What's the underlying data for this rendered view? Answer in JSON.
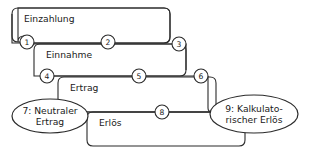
{
  "diagram": {
    "stroke_color": "#2b2b2b",
    "background_color": "#ffffff",
    "boxes": [
      {
        "id": "box-einzahlung",
        "label": "Einzahlung",
        "x": 12,
        "y": 8,
        "width": 158,
        "height": 35
      },
      {
        "id": "box-einnahme",
        "label": "Einnahme",
        "x": 34,
        "y": 44,
        "width": 152,
        "height": 32
      },
      {
        "id": "box-ertrag",
        "label": "Ertrag",
        "x": 58,
        "y": 77,
        "width": 158,
        "height": 35
      },
      {
        "id": "box-erloes",
        "label": "Erlös",
        "x": 87,
        "y": 112,
        "width": 158,
        "height": 34
      }
    ],
    "ellipses": [
      {
        "id": "ellipse-neutraler-ertrag",
        "label": "7: Neutraler\nErtrag",
        "cx": 50,
        "cy": 116,
        "rx": 38,
        "ry": 17
      },
      {
        "id": "ellipse-kalkulatorischer-erloes",
        "label": "9: Kalkulato-\nrischer Erlös",
        "cx": 254,
        "cy": 114,
        "rx": 44,
        "ry": 19
      }
    ],
    "markers": [
      {
        "id": "marker-1",
        "label": "1",
        "cx": 27,
        "cy": 42,
        "r": 7
      },
      {
        "id": "marker-2",
        "label": "2",
        "cx": 108,
        "cy": 42,
        "r": 7
      },
      {
        "id": "marker-3",
        "label": "3",
        "cx": 179,
        "cy": 44,
        "r": 7
      },
      {
        "id": "marker-4",
        "label": "4",
        "cx": 47,
        "cy": 76,
        "r": 7
      },
      {
        "id": "marker-5",
        "label": "5",
        "cx": 139,
        "cy": 76,
        "r": 7
      },
      {
        "id": "marker-6",
        "label": "6",
        "cx": 201,
        "cy": 76,
        "r": 7
      },
      {
        "id": "marker-8",
        "label": "8",
        "cx": 162,
        "cy": 112,
        "r": 7
      }
    ]
  }
}
